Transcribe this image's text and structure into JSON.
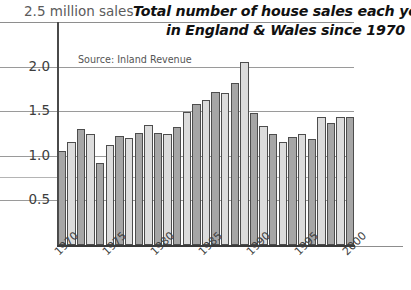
{
  "title": {
    "line1": "Total number of house sales each year",
    "line2": "in England & Wales since 1970"
  },
  "axis_caption": "2.5 million sales",
  "source_note": "Source: Inland Revenue",
  "chart_data": {
    "type": "bar",
    "title": "Total number of house sales each year in England & Wales since 1970",
    "subtitle": "Source: Inland Revenue",
    "xlabel": "",
    "ylabel": "million sales",
    "ylim": [
      0,
      2.5
    ],
    "yticks": [
      0.5,
      1.0,
      1.5,
      2.0,
      2.5
    ],
    "ytick_labels": [
      "0.5",
      "1.0",
      "1.5",
      "2.0",
      "2.5"
    ],
    "grid": true,
    "legend": "none",
    "xtick_values": [
      1970,
      1975,
      1980,
      1985,
      1990,
      1995,
      2000
    ],
    "xtick_labels": [
      "1970",
      "1975",
      "1980",
      "1985",
      "1990",
      "1995",
      "2000"
    ],
    "categories": [
      "1970",
      "1971",
      "1972",
      "1973",
      "1974",
      "1975",
      "1976",
      "1977",
      "1978",
      "1979",
      "1980",
      "1981",
      "1982",
      "1983",
      "1984",
      "1985",
      "1986",
      "1987",
      "1988",
      "1989",
      "1990",
      "1991",
      "1992",
      "1993",
      "1994",
      "1995",
      "1996",
      "1997",
      "1998",
      "1999",
      "2000"
    ],
    "values": [
      1.05,
      1.15,
      1.3,
      1.24,
      0.92,
      1.12,
      1.22,
      1.2,
      1.26,
      1.34,
      1.26,
      1.24,
      1.32,
      1.49,
      1.58,
      1.63,
      1.72,
      1.7,
      1.82,
      2.05,
      1.48,
      1.33,
      1.24,
      1.16,
      1.21,
      1.25,
      1.19,
      1.43,
      1.37,
      1.43,
      1.43
    ],
    "bar_styles": [
      "dark",
      "light",
      "dark",
      "light",
      "dark",
      "light",
      "dark",
      "light",
      "dark",
      "light",
      "dark",
      "light",
      "dark",
      "light",
      "dark",
      "light",
      "dark",
      "light",
      "dark",
      "light",
      "dark",
      "light",
      "dark",
      "light",
      "dark",
      "light",
      "dark",
      "light",
      "dark",
      "light",
      "dark"
    ],
    "colors": {
      "bar_dark": "#a6a6a6",
      "bar_light": "#dcdcdc",
      "bar_border": "#4d4d4d",
      "gridline": "#9a9a9a",
      "axis": "#4a4a4a",
      "text": "#3d3d3d",
      "title": "#111111",
      "background": "#ffffff"
    }
  }
}
